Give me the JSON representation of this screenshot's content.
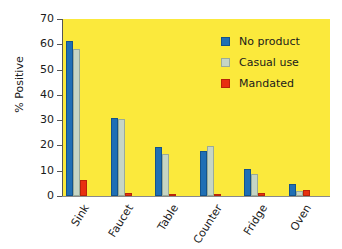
{
  "chart_data": {
    "type": "bar",
    "title": "",
    "xlabel": "",
    "ylabel": "% Positive",
    "ylim": [
      0,
      70
    ],
    "yticks": [
      0,
      10,
      20,
      30,
      40,
      50,
      60,
      70
    ],
    "grid": false,
    "legend_position": "top-right",
    "categories": [
      "Sink",
      "Faucet",
      "Table",
      "Counter",
      "Fridge",
      "Oven"
    ],
    "series": [
      {
        "name": "No product",
        "color": "#1f6fb5",
        "values": [
          61.5,
          30.7,
          19.3,
          18.0,
          10.7,
          4.8
        ]
      },
      {
        "name": "Casual use",
        "color": "#c6d5c4",
        "values": [
          58.0,
          30.6,
          16.5,
          19.9,
          8.6,
          2.0
        ]
      },
      {
        "name": "Mandated",
        "color": "#e83010",
        "values": [
          6.4,
          1.0,
          0.7,
          0.7,
          1.0,
          2.5
        ]
      }
    ],
    "plot_background": "#fbe93c",
    "page_background": "#ffffff"
  }
}
